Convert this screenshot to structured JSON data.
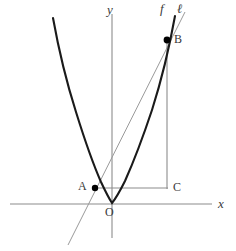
{
  "figure": {
    "kind": "coordinate-plane-diagram",
    "background_color": "#ffffff",
    "axis_color": "#8c8c8c",
    "curve_color": "#1a1a1a",
    "secant_color": "#9a9a9a",
    "segment_color": "#8c8c8c",
    "point_color": "#000000",
    "label_color": "#3a3a3a"
  },
  "axes": {
    "x_axis": {
      "label": "x",
      "y": 204,
      "x_start": 10,
      "x_end": 212
    },
    "y_axis": {
      "label": "y",
      "x": 112,
      "y_start": 14,
      "y_end": 238
    },
    "origin": {
      "label": "O",
      "x": 112,
      "y": 204
    }
  },
  "curves": {
    "parabola": {
      "label": "f",
      "vertex": {
        "x": 112,
        "y": 203
      },
      "path": "M 53 18 Q 62 68 76 112 Q 90 157 101 182 Q 108 197 112 203 Q 117 197 125 181 Q 138 152 152 110 Q 166 66 175 16"
    },
    "secant_line": {
      "label": "ℓ",
      "path": "M 68 245 L 185 12"
    }
  },
  "points": [
    {
      "name": "A",
      "label": "A",
      "x": 95,
      "y": 188,
      "radius": 3.2
    },
    {
      "name": "B",
      "label": "B",
      "x": 167,
      "y": 40,
      "radius": 3.4
    }
  ],
  "markers": [
    {
      "name": "C",
      "label": "C",
      "x": 167,
      "y": 188
    }
  ],
  "segments": [
    {
      "name": "segment-AC",
      "x1": 95,
      "y1": 188,
      "x2": 168,
      "y2": 188
    },
    {
      "name": "segment-BC",
      "x1": 167,
      "y1": 41,
      "x2": 167,
      "y2": 189
    }
  ]
}
